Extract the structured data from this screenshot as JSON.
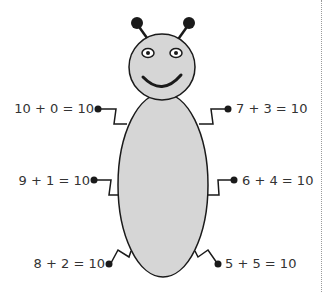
{
  "diagram": {
    "colors": {
      "body_fill": "#d6d6d6",
      "outline": "#1a1a1a",
      "text": "#333333",
      "background": "#ffffff"
    },
    "equations": {
      "left": [
        {
          "label": "10 + 0 = 10"
        },
        {
          "label": "9 + 1 = 10"
        },
        {
          "label": "8 + 2 = 10"
        }
      ],
      "right": [
        {
          "label": "7 + 3 = 10"
        },
        {
          "label": "6 + 4 = 10"
        },
        {
          "label": "5 + 5 = 10"
        }
      ]
    }
  }
}
